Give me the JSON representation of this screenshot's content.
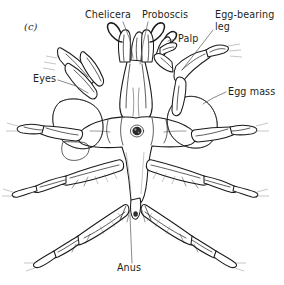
{
  "figure": {
    "panel_letter": "(c)",
    "background_color": "#ffffff",
    "ink_color": "#1a1a1a",
    "leader_color": "#58595b",
    "text_color": "#231f20"
  },
  "labels": [
    {
      "id": "chelicera",
      "text": "Chelicera",
      "x": 85,
      "y": 18,
      "anchor": "start",
      "leader": [
        [
          123,
          22
        ],
        [
          130,
          40
        ],
        [
          133,
          58
        ]
      ]
    },
    {
      "id": "proboscis",
      "text": "Proboscis",
      "x": 142,
      "y": 18,
      "anchor": "start",
      "leader": [
        [
          148,
          22
        ],
        [
          143,
          44
        ],
        [
          140,
          64
        ]
      ]
    },
    {
      "id": "palp",
      "text": "Palp",
      "x": 178,
      "y": 42,
      "anchor": "start",
      "leader": [
        [
          176,
          39
        ],
        [
          168,
          41
        ]
      ]
    },
    {
      "id": "egg-bearing-leg",
      "text": "Egg-bearing",
      "text_line2": "leg",
      "x": 215,
      "y": 18,
      "anchor": "start",
      "leader": [
        [
          213,
          30
        ],
        [
          196,
          52
        ],
        [
          182,
          70
        ]
      ]
    },
    {
      "id": "eyes",
      "text": "Eyes",
      "x": 33,
      "y": 82,
      "anchor": "start",
      "leader": [
        [
          58,
          80
        ],
        [
          76,
          86
        ],
        [
          88,
          93
        ]
      ]
    },
    {
      "id": "egg-mass",
      "text": "Egg mass",
      "x": 228,
      "y": 95,
      "anchor": "start",
      "leader": [
        [
          226,
          92
        ],
        [
          213,
          98
        ],
        [
          203,
          104
        ]
      ]
    },
    {
      "id": "anus",
      "text": "Anus",
      "x": 129,
      "y": 271,
      "anchor": "middle",
      "leader": [
        [
          132,
          263
        ],
        [
          131,
          240
        ],
        [
          130,
          215
        ]
      ]
    }
  ],
  "anatomy": {
    "eye_tubercle": "central dark ocular tubercle",
    "mouth": "dark terminal mouth opening on proboscis",
    "leg_pairs": 4,
    "egg_masses": 2,
    "texture": "stippled granular egg masses, hatched leg segments"
  }
}
